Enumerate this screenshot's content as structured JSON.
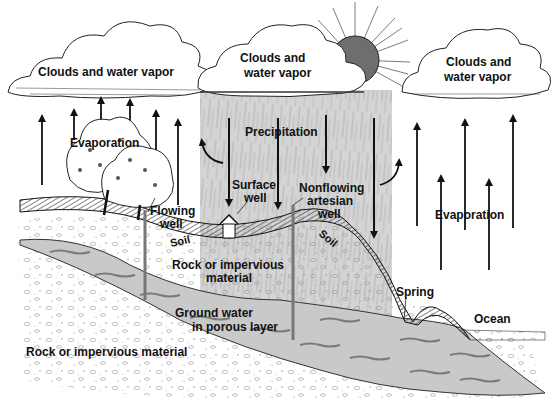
{
  "diagram": {
    "type": "water-cycle",
    "colors": {
      "ink": "#111111",
      "rain_band": "#d2d2d2",
      "sun_fill": "#6e6e6e",
      "aquifer": "#c8c8c8",
      "aquifer_streak": "#7a7a7a",
      "soil_hatch": "#333333",
      "background": "#ffffff"
    },
    "labels": {
      "clouds_left": "Clouds and water vapor",
      "clouds_center_line1": "Clouds and",
      "clouds_center_line2": "water vapor",
      "clouds_right_line1": "Clouds and",
      "clouds_right_line2": "water vapor",
      "evaporation_left": "Evaporation",
      "precipitation": "Precipitation",
      "surface_well_line1": "Surface",
      "surface_well_line2": "well",
      "nonflowing_line1": "Nonflowing",
      "nonflowing_line2": "artesian",
      "nonflowing_line3": "well",
      "flowing_well_line1": "Flowing",
      "flowing_well_line2": "well",
      "soil_left": "Soil",
      "soil_right": "Soil",
      "rock_upper_line1": "Rock or impervious",
      "rock_upper_line2": "material",
      "groundwater_line1": "Ground water",
      "groundwater_line2": "in porous layer",
      "rock_lower": "Rock or impervious material",
      "spring": "Spring",
      "ocean": "Ocean",
      "evaporation_right": "Evaporation"
    },
    "elements": [
      "clouds-left",
      "clouds-center",
      "clouds-right",
      "sun",
      "precipitation-band",
      "evaporation-arrows-left",
      "evaporation-arrows-right",
      "precipitation-arrows",
      "trees",
      "soil-layer",
      "aquifer",
      "flowing-well",
      "surface-well",
      "nonflowing-artesian-well",
      "spring",
      "ocean"
    ]
  }
}
